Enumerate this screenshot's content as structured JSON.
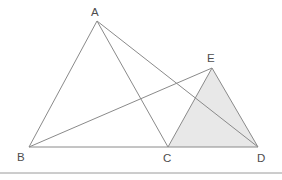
{
  "figure": {
    "background_color": "#ffffff",
    "line_color": "#8a8a8a",
    "label_color": "#4d4d4d",
    "shade_color": "#e8e8e8",
    "divider_color": "#9a9a9a",
    "points": {
      "A": {
        "label": "A",
        "x": 97,
        "y": 21,
        "label_x": 91,
        "label_y": 16
      },
      "B": {
        "label": "B",
        "x": 29,
        "y": 147,
        "label_x": 17,
        "label_y": 161
      },
      "C": {
        "label": "C",
        "x": 168,
        "y": 147,
        "label_x": 163,
        "label_y": 162
      },
      "D": {
        "label": "D",
        "x": 258,
        "y": 147,
        "label_x": 257,
        "label_y": 162
      },
      "E": {
        "label": "E",
        "x": 212,
        "y": 68,
        "label_x": 207,
        "label_y": 62
      }
    },
    "segments": [
      {
        "name": "segment-AB",
        "from": "A",
        "to": "B"
      },
      {
        "name": "segment-AC",
        "from": "A",
        "to": "C"
      },
      {
        "name": "segment-AD",
        "from": "A",
        "to": "D"
      },
      {
        "name": "segment-BE",
        "from": "B",
        "to": "E"
      },
      {
        "name": "segment-BD",
        "from": "B",
        "to": "D"
      },
      {
        "name": "segment-CE",
        "from": "C",
        "to": "E"
      },
      {
        "name": "segment-ED",
        "from": "E",
        "to": "D"
      }
    ],
    "shaded_regions": [
      {
        "name": "triangle-CED",
        "vertices": [
          "C",
          "E",
          "D"
        ],
        "fill": "#e8e8e8"
      }
    ],
    "divider": {
      "name": "bottom-divider",
      "y": 173
    }
  }
}
